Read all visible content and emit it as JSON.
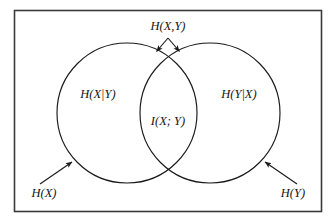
{
  "figure": {
    "background_color": "#ffffff",
    "stroke_color": "#1a1a1a",
    "text_color": "#151515"
  },
  "frame": {
    "name": "outer-border",
    "x": 14,
    "y": 10,
    "width": 308,
    "height": 202
  },
  "circles": [
    {
      "name": "entropy-x-circle",
      "cx": 127,
      "cy": 113,
      "r": 70
    },
    {
      "name": "entropy-y-circle",
      "cx": 210,
      "cy": 113,
      "r": 70
    }
  ],
  "labels": {
    "joint_entropy": "H(X,Y)",
    "conditional_x_given_y": "H(X|Y)",
    "mutual_information": "I(X; Y)",
    "conditional_y_given_x": "H(Y|X)",
    "entropy_x": "H(X)",
    "entropy_y": "H(Y)"
  },
  "label_positions": {
    "joint_entropy": {
      "x": 168,
      "y": 30
    },
    "conditional_x_given_y": {
      "x": 98,
      "y": 98
    },
    "mutual_information": {
      "x": 168,
      "y": 125
    },
    "conditional_y_given_x": {
      "x": 239,
      "y": 98
    },
    "entropy_x": {
      "x": 44,
      "y": 197
    },
    "entropy_y": {
      "x": 293,
      "y": 197
    }
  },
  "annotations": [
    {
      "name": "joint-entropy-left-arrow",
      "from": {
        "x": 168,
        "y": 38
      },
      "to": {
        "x": 155,
        "y": 53
      },
      "target": "upper-intersection"
    },
    {
      "name": "joint-entropy-right-arrow",
      "from": {
        "x": 168,
        "y": 38
      },
      "to": {
        "x": 181,
        "y": 53
      },
      "target": "upper-intersection"
    },
    {
      "name": "entropy-x-arrow",
      "from": {
        "x": 40,
        "y": 184
      },
      "to": {
        "x": 73,
        "y": 161
      },
      "target": "entropy-x-circle"
    },
    {
      "name": "entropy-y-arrow",
      "from": {
        "x": 297,
        "y": 184
      },
      "to": {
        "x": 264,
        "y": 161
      },
      "target": "entropy-y-circle"
    }
  ]
}
